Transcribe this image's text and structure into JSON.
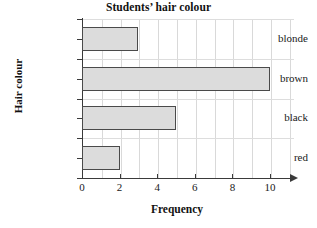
{
  "chart_data": {
    "type": "bar",
    "orientation": "horizontal",
    "title": "Students’ hair colour",
    "xlabel": "Frequency",
    "ylabel": "Hair colour",
    "categories": [
      "blonde",
      "brown",
      "black",
      "red"
    ],
    "values": [
      3,
      10,
      5,
      2
    ],
    "xlim": [
      0,
      11.2
    ],
    "xticks": [
      0,
      2,
      4,
      6,
      8,
      10
    ],
    "xtick_labels": [
      "0",
      "2",
      "4",
      "6",
      "8",
      "10"
    ],
    "grid": true,
    "legend": null,
    "bar_fill_color": "#dcdcdc",
    "bar_edge_color": "#4a4a4a",
    "axis_color": "#3a3a3a",
    "gridline_color": "#d9d9d9",
    "background_color": "#ffffff",
    "series": [
      {
        "name": "Frequency",
        "points": [
          {
            "category": "blonde",
            "value": 3
          },
          {
            "category": "brown",
            "value": 10
          },
          {
            "category": "black",
            "value": 5
          },
          {
            "category": "red",
            "value": 2
          }
        ]
      }
    ]
  }
}
